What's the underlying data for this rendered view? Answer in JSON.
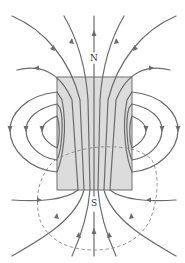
{
  "diagram": {
    "labels": {
      "north": "N",
      "south": "S"
    },
    "magnet": {
      "x": 57,
      "y": 77,
      "width": 75,
      "height": 113,
      "fill": "#dcdcdc"
    },
    "colors": {
      "field_line": "#6b6b6b",
      "dashed_surface": "#8a8a8a",
      "magnet_fill": "#dcdcdc",
      "background": "#ffffff"
    },
    "elements": {
      "field_lines": "curves exit top (N) and enter bottom (S), arrows pointing up",
      "side_loops": "three closed loops on each side of the magnet",
      "dashed_surface": "closed dashed curve crossing lower half of the magnet"
    }
  }
}
